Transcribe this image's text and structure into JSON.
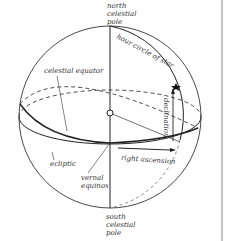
{
  "diagram": {
    "labels": {
      "ncp": [
        "north",
        "celestial",
        "pole"
      ],
      "scp": [
        "south",
        "celestial",
        "pole"
      ],
      "hour_circle": "hour circle of star",
      "celestial_equator": "celestial equator",
      "declination": "declination",
      "right_ascension": "right ascension",
      "ecliptic": "ecliptic",
      "vernal_equinox": [
        "vernal",
        "equinox"
      ]
    },
    "colors": {
      "line": "#222222",
      "text": "#333333",
      "background": "#ffffff",
      "frame": "#777777"
    }
  }
}
